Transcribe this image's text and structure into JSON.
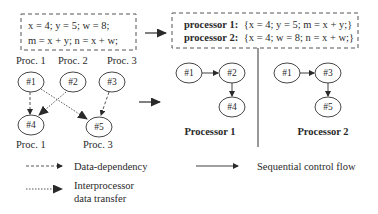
{
  "source_block": {
    "line1": "x = 4; y = 5; w = 8;",
    "line2": "m = x + y; n = x + w;"
  },
  "partitioned_block": {
    "line1_label": "processor 1:",
    "line1_code": "{x = 4; y = 5; m = x + y;}",
    "line2_label": "processor 2:",
    "line2_code": "{x = 4; w = 8; n = x + w;}"
  },
  "task_graph": {
    "nodes": [
      {
        "id": "#1",
        "proc": "Proc. 1"
      },
      {
        "id": "#2",
        "proc": "Proc. 2"
      },
      {
        "id": "#3",
        "proc": "Proc. 3"
      },
      {
        "id": "#4",
        "proc": "Proc. 1"
      },
      {
        "id": "#5",
        "proc": "Proc. 3"
      }
    ],
    "edges": [
      {
        "from": "#1",
        "to": "#4",
        "type": "data-dependency"
      },
      {
        "from": "#2",
        "to": "#4",
        "type": "interprocessor"
      },
      {
        "from": "#1",
        "to": "#5",
        "type": "interprocessor"
      },
      {
        "from": "#3",
        "to": "#5",
        "type": "data-dependency"
      }
    ]
  },
  "processor1": {
    "title": "Processor 1",
    "nodes": [
      "#1",
      "#2",
      "#4"
    ]
  },
  "processor2": {
    "title": "Processor 2",
    "nodes": [
      "#1",
      "#3",
      "#5"
    ]
  },
  "legend": {
    "data_dependency": "Data-dependency",
    "sequential": "Sequential control flow",
    "interprocessor_line1": "Interprocessor",
    "interprocessor_line2": "data transfer"
  },
  "colors": {
    "ink": "#2a2a2a",
    "dash": "#555555"
  }
}
